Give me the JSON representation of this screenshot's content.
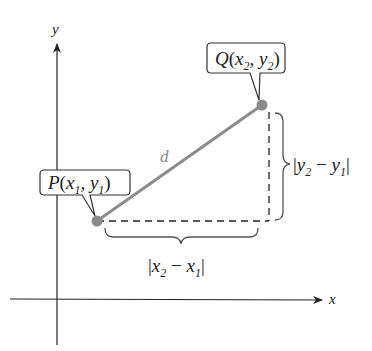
{
  "diagram": {
    "axes": {
      "x_label": "x",
      "y_label": "y"
    },
    "points": {
      "P": {
        "name": "P",
        "sub_x": "1",
        "sub_y": "1",
        "label": "P(x1, y1)"
      },
      "Q": {
        "name": "Q",
        "sub_x": "2",
        "sub_y": "2",
        "label": "Q(x2, y2)"
      }
    },
    "segment_label": "d",
    "horizontal_distance": {
      "label": "|x2 − x1|",
      "v1": "x",
      "s1": "2",
      "op": "−",
      "v2": "x",
      "s2": "1"
    },
    "vertical_distance": {
      "label": "|y2 − y1|",
      "v1": "y",
      "s1": "2",
      "op": "−",
      "v2": "y",
      "s2": "1"
    },
    "colors": {
      "segment": "#8c8c8c",
      "point": "#8a8a8a",
      "axes": "#222222",
      "dashed": "#222222",
      "brace": "#555555"
    }
  }
}
